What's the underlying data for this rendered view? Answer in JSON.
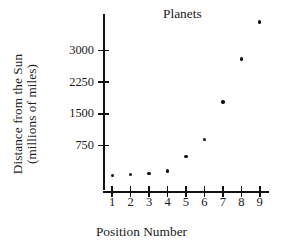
{
  "chart_data": {
    "type": "scatter",
    "title": "Planets",
    "xlabel": "Position Number",
    "ylabel": "Distance from the Sun (millions of miles)",
    "ylabel_line1": "Distance from the Sun",
    "ylabel_line2": "(millions of miles)",
    "x": [
      1,
      2,
      3,
      4,
      5,
      6,
      7,
      8,
      9
    ],
    "y": [
      36,
      67,
      93,
      142,
      484,
      890,
      1780,
      2800,
      3670
    ],
    "xticks": [
      "1",
      "2",
      "3",
      "4",
      "5",
      "6",
      "7",
      "8",
      "9"
    ],
    "yticks": [
      "750",
      "1500",
      "2250",
      "3000"
    ],
    "ytick_values": [
      750,
      1500,
      2250,
      3000
    ],
    "xlim": [
      0.5,
      9.5
    ],
    "ylim": [
      0,
      4000
    ],
    "grid": false,
    "legend": null,
    "marker": "dot",
    "marker_color": "#111111",
    "axis_color": "#111111",
    "background": "#ffffff"
  }
}
